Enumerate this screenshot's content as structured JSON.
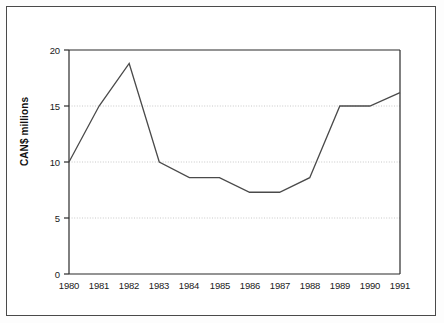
{
  "figure": {
    "background_color": "#ffffff",
    "frame_color": "#4a4a4a",
    "axis_color": "#1a1a1a",
    "grid_color": "#c8c8c8",
    "line_color": "#4a4a4a"
  },
  "chart_data": {
    "type": "line",
    "title": "",
    "xlabel": "",
    "ylabel": "CAN$ millions",
    "categories": [
      "1980",
      "1981",
      "1982",
      "1983",
      "1984",
      "1985",
      "1986",
      "1987",
      "1988",
      "1989",
      "1990",
      "1991"
    ],
    "x": [
      1980,
      1981,
      1982,
      1983,
      1984,
      1985,
      1986,
      1987,
      1988,
      1989,
      1990,
      1991
    ],
    "values": [
      10.0,
      15.0,
      18.8,
      10.0,
      8.6,
      8.6,
      7.3,
      7.3,
      8.6,
      15.0,
      15.0,
      16.2
    ],
    "series": [
      {
        "name": "CAN$ millions",
        "values": [
          10.0,
          15.0,
          18.8,
          10.0,
          8.6,
          8.6,
          7.3,
          7.3,
          8.6,
          15.0,
          15.0,
          16.2
        ]
      }
    ],
    "ylim": [
      0,
      20
    ],
    "xlim": [
      1980,
      1991
    ],
    "yticks": [
      0,
      5,
      10,
      15,
      20
    ],
    "ytick_labels": [
      "0",
      "5",
      "10",
      "15",
      "20"
    ],
    "xtick_labels": [
      "1980",
      "1981",
      "1982",
      "1983",
      "1984",
      "1985",
      "1986",
      "1987",
      "1988",
      "1989",
      "1990",
      "1991"
    ],
    "grid": true,
    "grid_axis": "y",
    "legend": false,
    "legend_position": "none"
  }
}
